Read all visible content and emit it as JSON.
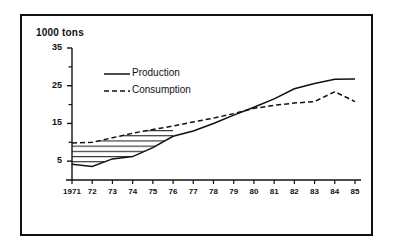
{
  "figure": {
    "unit_label": "1000 tons",
    "frame": true
  },
  "chart_data": {
    "type": "line",
    "title": "",
    "subtitle": "",
    "xlabel": "",
    "ylabel": "1000 tons",
    "unit_label": "1000 tons",
    "grid": false,
    "legend_position": "upper-left-inside",
    "x": [
      1971,
      1972,
      1973,
      1974,
      1975,
      1976,
      1977,
      1978,
      1979,
      1980,
      1981,
      1982,
      1983,
      1984,
      1985
    ],
    "xtick_labels": [
      "1971",
      "72",
      "73",
      "74",
      "75",
      "76",
      "77",
      "78",
      "79",
      "80",
      "81",
      "82",
      "83",
      "84",
      "85"
    ],
    "xlim": [
      1971,
      1985
    ],
    "ylim": [
      0,
      35
    ],
    "ytick_values": [
      5,
      15,
      25,
      35
    ],
    "ytick_labels": [
      "5",
      "15",
      "25",
      "35"
    ],
    "yminor_tick_values": [
      10,
      20,
      30
    ],
    "series": [
      {
        "name": "Production",
        "style": "solid",
        "color": "#111111",
        "values": [
          4.2,
          3.6,
          5.6,
          6.2,
          8.6,
          11.6,
          13.0,
          15.0,
          17.2,
          19.3,
          21.5,
          24.2,
          25.6,
          26.7,
          26.8
        ]
      },
      {
        "name": "Consumption",
        "style": "dashed",
        "color": "#111111",
        "values": [
          9.8,
          10.0,
          11.2,
          12.4,
          13.4,
          14.3,
          15.4,
          16.4,
          17.6,
          19.0,
          19.8,
          20.4,
          20.8,
          23.4,
          20.8
        ]
      }
    ],
    "annotations": [
      {
        "type": "hatched-band",
        "description": "horizontal line hatching filling gap between Production and Consumption curves",
        "from_x": 1971,
        "to_x": 1976
      }
    ]
  },
  "legend": {
    "entries": [
      {
        "label": "Production",
        "style": "solid"
      },
      {
        "label": "Consumption",
        "style": "dashed"
      }
    ]
  }
}
